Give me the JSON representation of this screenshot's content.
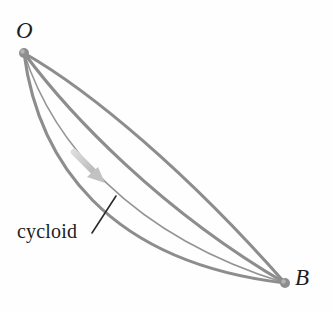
{
  "figure": {
    "background_color": "#fefefe",
    "width": 333,
    "height": 311
  },
  "points": [
    {
      "id": "O",
      "label": "O",
      "x": 24,
      "y": 53,
      "dot_radius": 5,
      "dot_color": "#8e8e8e",
      "label_x": 16,
      "label_y": 19,
      "style": "italic"
    },
    {
      "id": "B",
      "label": "B",
      "x": 285,
      "y": 283,
      "dot_radius": 5,
      "dot_color": "#8e8e8e",
      "label_x": 295,
      "label_y": 266,
      "style": "italic"
    }
  ],
  "annotations": {
    "curve_label": {
      "text": "cycloid",
      "x": 17,
      "y": 221,
      "font_size": 20,
      "color": "#1d1d1d"
    },
    "leader_line": {
      "from_x": 92,
      "from_y": 233,
      "to_x": 116,
      "to_y": 196,
      "color": "#2b2b2b",
      "width": 1.6
    },
    "motion_arrow": {
      "description": "direction-of-travel arrow along descent path",
      "from_x": 74,
      "from_y": 152,
      "to_x": 103,
      "to_y": 181,
      "color": "#c9c9c9"
    }
  },
  "curves": {
    "stroke_color": "#8d8d8d",
    "list": [
      {
        "id": "path-1",
        "name": "shallow-arc",
        "stroke_width": 3.1,
        "sag": 22,
        "d": "M 24 53 C 92 92, 188 173, 285 283"
      },
      {
        "id": "path-2",
        "name": "medium-arc",
        "stroke_width": 3.1,
        "sag": 52,
        "d": "M 24 53 C 70 115, 160 210, 285 283"
      },
      {
        "id": "path-3",
        "name": "thin-inner-arc",
        "stroke_width": 1.5,
        "sag": 76,
        "d": "M 24 53 C 52 140, 128 235, 285 283"
      },
      {
        "id": "path-4",
        "name": "cycloid-arc",
        "stroke_width": 3.1,
        "sag": 100,
        "d": "M 24 53 C 38 160, 106 262, 285 283"
      }
    ]
  }
}
